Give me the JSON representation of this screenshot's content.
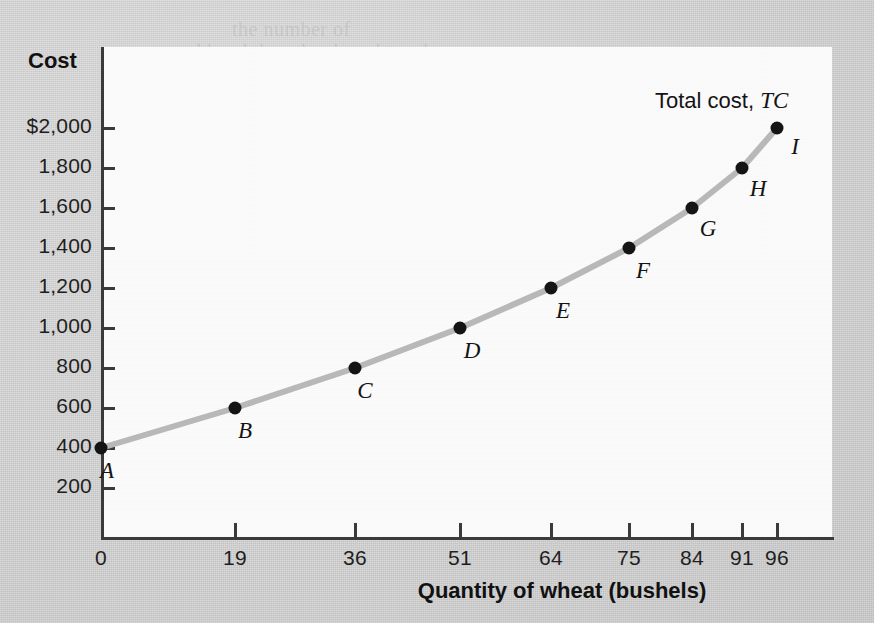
{
  "figure": {
    "background_color": "#d4d4d4",
    "panel_color": "#fbfbfb",
    "curve_color": "#b8b8b8",
    "marker_color": "#141414",
    "axis_color": "#3a3a3a"
  },
  "axes": {
    "y_title": "Cost",
    "x_title": "Quantity of wheat (bushels)",
    "y_tick_labels": [
      "$2,000",
      "1,800",
      "1,600",
      "1,400",
      "1,200",
      "1,000",
      "800",
      "600",
      "400",
      "200"
    ],
    "y_tick_values": [
      2000,
      1800,
      1600,
      1400,
      1200,
      1000,
      800,
      600,
      400,
      200
    ],
    "x_tick_labels": [
      "0",
      "19",
      "36",
      "51",
      "64",
      "75",
      "84",
      "91",
      "96"
    ],
    "x_tick_values": [
      0,
      19,
      36,
      51,
      64,
      75,
      84,
      91,
      96
    ]
  },
  "series_annotation": {
    "prefix": "Total cost, ",
    "symbol": "TC"
  },
  "chart_data": {
    "type": "line",
    "title": "",
    "xlabel": "Quantity of wheat (bushels)",
    "ylabel": "Cost",
    "xlim": [
      0,
      100
    ],
    "ylim": [
      0,
      2100
    ],
    "grid": false,
    "legend": "inline-annotation",
    "series": [
      {
        "name": "Total cost, TC",
        "point_labels": [
          "A",
          "B",
          "C",
          "D",
          "E",
          "F",
          "G",
          "H",
          "I"
        ],
        "x": [
          0,
          19,
          36,
          51,
          64,
          75,
          84,
          91,
          96
        ],
        "y": [
          400,
          600,
          800,
          1000,
          1200,
          1400,
          1600,
          1800,
          2000
        ]
      }
    ],
    "points": [
      {
        "label": "A",
        "x": 0,
        "y": 400
      },
      {
        "label": "B",
        "x": 19,
        "y": 600
      },
      {
        "label": "C",
        "x": 36,
        "y": 800
      },
      {
        "label": "D",
        "x": 51,
        "y": 1000
      },
      {
        "label": "E",
        "x": 64,
        "y": 1200
      },
      {
        "label": "F",
        "x": 75,
        "y": 1400
      },
      {
        "label": "G",
        "x": 84,
        "y": 1600
      },
      {
        "label": "H",
        "x": 91,
        "y": 1800
      },
      {
        "label": "I",
        "x": 96,
        "y": 2000
      }
    ]
  },
  "ghost_text": [
    {
      "text": "the number of",
      "x": 232,
      "y": 18
    },
    {
      "text": "a second hand the other bought and you",
      "x": 128,
      "y": 40
    },
    {
      "text": "the of producing the",
      "x": 300,
      "y": 64
    },
    {
      "text": "and following a very description of the",
      "x": 150,
      "y": 110
    }
  ]
}
